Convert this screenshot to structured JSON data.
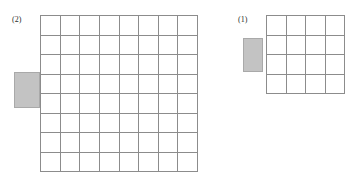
{
  "page": {
    "background_color": "#ffffff",
    "width": 351,
    "height": 186
  },
  "style": {
    "grid_line_color": "#8c8c8c",
    "bar_fill_color": "#c3c3c3",
    "bar_border_color": "#a9a9a9",
    "label_color": "#2b2b2b"
  },
  "figures": [
    {
      "id": "left",
      "label": "(2)",
      "grid": {
        "columns": 8,
        "rows": 8,
        "total_cells": 64
      },
      "bar": {
        "position": "left",
        "fill": "#c3c3c3"
      }
    },
    {
      "id": "right",
      "label": "(1)",
      "grid": {
        "columns": 4,
        "rows": 4,
        "total_cells": 16
      },
      "bar": {
        "position": "left",
        "fill": "#c3c3c3"
      }
    }
  ]
}
